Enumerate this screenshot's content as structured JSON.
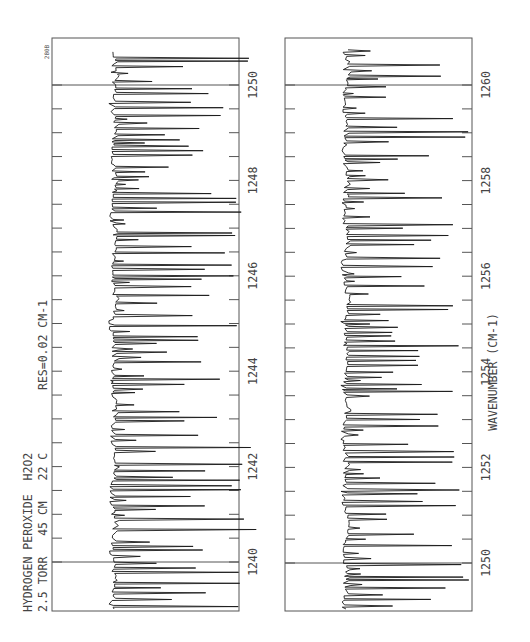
{
  "figure_id": "280B",
  "annotations": {
    "title_line1": "HYDROGEN PEROXIDE  H2O2",
    "title_line2": "2.5 TORR   45 CM   22 C",
    "resolution": "RES=0.02 CM-1",
    "xlabel": "WAVENUMBER (CM-1)"
  },
  "chart_data": [
    {
      "type": "line",
      "title": "HYDROGEN PEROXIDE H2O2 — 2.5 TORR 45 CM 22 C, RES=0.02 CM-1",
      "xlabel": "",
      "ylabel": "Transmittance (absorption dips)",
      "orientation": "rotated-90 (wavenumber increases upward, absorption extends right)",
      "xlim": [
        1239.0,
        1251.0
      ],
      "tick_labels": [
        "1240",
        "1242",
        "1244",
        "1246",
        "1248",
        "1250"
      ],
      "tick_values": [
        1240,
        1240.5,
        1241,
        1241.5,
        1242,
        1242.5,
        1243,
        1243.5,
        1244,
        1244.5,
        1245,
        1245.5,
        1246,
        1246.5,
        1247,
        1247.5,
        1248,
        1248.5,
        1249,
        1249.5,
        1250
      ],
      "reference_lines": [
        1240,
        1250
      ],
      "grid": false,
      "description": "Dense rotational absorption spectrum of H2O2; many sharp lines with depths up to ~60% of panel width."
    },
    {
      "type": "line",
      "title": "",
      "xlabel": "WAVENUMBER (CM-1)",
      "ylabel": "Transmittance (absorption dips)",
      "orientation": "rotated-90 (wavenumber increases upward, absorption extends right)",
      "xlim": [
        1249.0,
        1261.0
      ],
      "tick_labels": [
        "1250",
        "1252",
        "1254",
        "1256",
        "1258",
        "1260"
      ],
      "tick_values": [
        1250,
        1250.5,
        1251,
        1251.5,
        1252,
        1252.5,
        1253,
        1253.5,
        1254,
        1254.5,
        1255,
        1255.5,
        1256,
        1256.5,
        1257,
        1257.5,
        1258,
        1258.5,
        1259,
        1259.5,
        1260
      ],
      "reference_lines": [
        1250,
        1260
      ],
      "grid": false,
      "description": "Continuation of H2O2 spectrum; dense sharp absorption lines."
    }
  ],
  "panels": [
    {
      "id": "left",
      "frame": {
        "x": 52,
        "y": 38,
        "w": 187,
        "h": 573
      },
      "baseline_x": 114,
      "max_depth": 130,
      "wn_at_y": {
        "v0": 1240,
        "y0": 562,
        "v1": 1250,
        "y1": 85
      },
      "labels": [
        "1240",
        "1242",
        "1244",
        "1246",
        "1248",
        "1250"
      ],
      "seed": 7
    },
    {
      "id": "right",
      "frame": {
        "x": 285,
        "y": 38,
        "w": 187,
        "h": 573
      },
      "baseline_x": 346,
      "max_depth": 115,
      "wn_at_y": {
        "v0": 1250,
        "y0": 563,
        "v1": 1260,
        "y1": 85
      },
      "labels": [
        "1250",
        "1252",
        "1254",
        "1256",
        "1258",
        "1260"
      ],
      "seed": 23
    }
  ],
  "colors": {
    "frame": "#555555",
    "trace": "#1a1a1a",
    "text": "#444444",
    "background": "#ffffff"
  }
}
